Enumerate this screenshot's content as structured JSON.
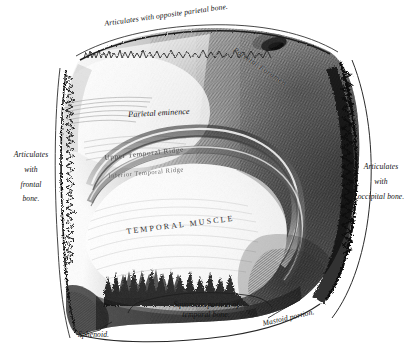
{
  "figure": {
    "background_color": "#ffffff",
    "ink_color": "#1a1a1a"
  },
  "labels": {
    "top_suture": "Articulates with opposite parietal bone.",
    "parietal_foramen": "Parietal Foramen",
    "parietal_eminence": "Parietal eminence",
    "upper_temporal_ridge": "Upper Temporal Ridge",
    "inferior_temporal_ridge": "Inferior Temporal Ridge",
    "temporal_muscle": "TEMPORAL MUSCLE",
    "left_articulates": "Articulates",
    "left_with": "with",
    "left_frontal": "frontal",
    "left_bone": "bone.",
    "right_articulates": "Articulates",
    "right_with": "with",
    "right_occipital_bone": "occipital bone.",
    "squamous_line1": "Squamous portion of",
    "squamous_line2": "temporal bone.",
    "mastoid_portion": "Mastoid portion.",
    "sphenoid": "Sphenoid."
  }
}
